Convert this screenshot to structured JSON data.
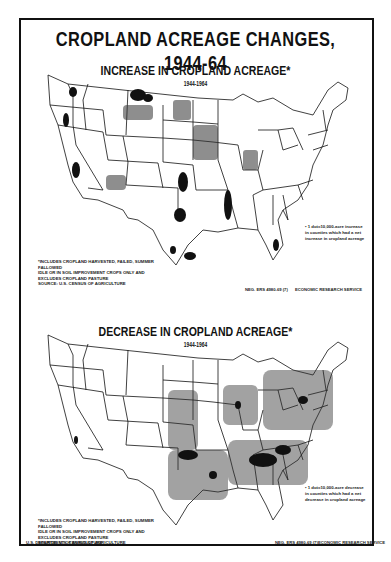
{
  "title": "CROPLAND ACREAGE CHANGES, 1944-64",
  "maps": [
    {
      "id": "increase",
      "title": "INCREASE IN CROPLAND ACREAGE*",
      "years": "1944-1964",
      "legend": "• 1 dot=10,000-acre increase in counties which had a net increase in cropland acreage",
      "footnote": [
        "*INCLUDES CROPLAND HARVESTED, FAILED, SUMMER FALLOWED",
        "IDLE OR IN SOIL IMPROVEMENT CROPS ONLY AND",
        "EXCLUDES CROPLAND PASTURE",
        "SOURCE: U.S. CENSUS OF AGRICULTURE"
      ],
      "negative_number": "NEG. ERS 4980-69 (7)",
      "agency": "ECONOMIC RESEARCH SERVICE",
      "dense_regions": [
        "Northern Montana",
        "Eastern Washington",
        "California Central Valley",
        "Eastern Colorado / Western Kansas",
        "Texas High Plains",
        "Mississippi Delta",
        "Southern Florida",
        "Texas Gulf Coast"
      ]
    },
    {
      "id": "decrease",
      "title": "DECREASE IN CROPLAND ACREAGE*",
      "years": "1944-1964",
      "legend": "• 1 dot=10,000-acre decrease in counties which had a net decrease in cropland acreage",
      "footnote": [
        "*INCLUDES CROPLAND HARVESTED, FAILED, SUMMER FALLOWED",
        "IDLE OR IN SOIL IMPROVEMENT CROPS ONLY AND",
        "EXCLUDES CROPLAND PASTURE",
        "SOURCE: U.S. CENSUS OF AGRICULTURE"
      ],
      "negative_number": "NEG. ERS 4980-69 (7)",
      "agency": "ECONOMIC RESEARCH SERVICE",
      "dense_regions": [
        "Southeast (Georgia, Alabama, Carolinas)",
        "Oklahoma / North Texas",
        "Northeast / Appalachia",
        "Tennessee / Kentucky",
        "Michigan / Wisconsin"
      ]
    }
  ],
  "department": "U.S. DEPARTMENT OF AGRICULTURE",
  "colors": {
    "ink": "#111111",
    "paper": "#ffffff"
  }
}
